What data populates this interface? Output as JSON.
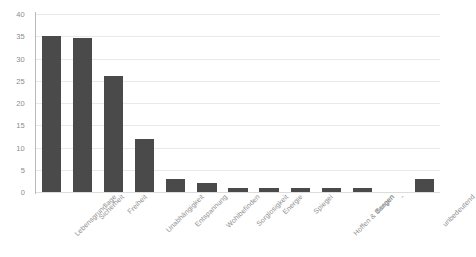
{
  "chart_data": {
    "type": "bar",
    "title": "",
    "subtitle": "",
    "xlabel": "",
    "ylabel": "",
    "ylim": [
      0,
      40
    ],
    "yticks": [
      0,
      5,
      10,
      15,
      20,
      25,
      30,
      35,
      40
    ],
    "grid": true,
    "legend": false,
    "legend_position": "none",
    "bar_color": "#4a4a4a",
    "grid_color": "#e9e9e9",
    "axis_color": "#b8b8b8",
    "tick_label_color": "#8c8c8c",
    "categories": [
      "Lebensgrundlage",
      "Sicherheit",
      "Freiheit",
      "Unabhängigkeit",
      "Entspannung",
      "Wohlbefinden",
      "Sorglosigkeit",
      "Energie",
      "Spiegel",
      "Hoffen & Bangen",
      "Sorgen",
      "-",
      "unbedeutend"
    ],
    "values": [
      35,
      34.5,
      26,
      12,
      3,
      2,
      1,
      1,
      1,
      1,
      1,
      0,
      3
    ],
    "annotations": []
  }
}
